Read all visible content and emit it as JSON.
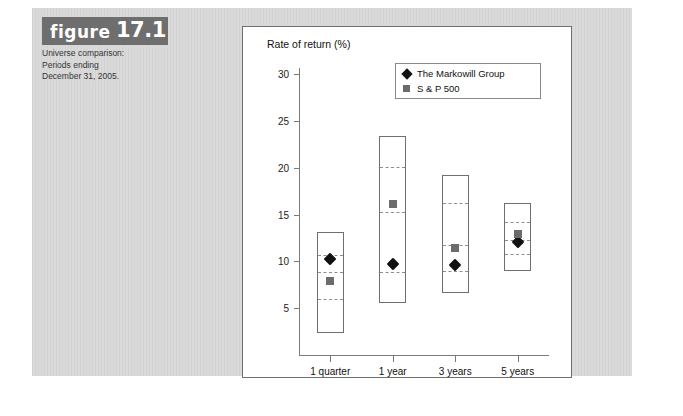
{
  "figure": {
    "tag_word": "figure",
    "tag_number": "17.1",
    "caption_lines": [
      "Universe comparison:",
      "Periods ending",
      "December 31, 2005."
    ],
    "tag_bg": "#6e6e6e",
    "plate_bg": "#d9d9d9"
  },
  "legend": {
    "items": [
      {
        "label": "The Markowill Group",
        "marker": "diamond",
        "color": "#111111"
      },
      {
        "label": "S & P 500",
        "marker": "square",
        "color": "#6b6b6b"
      }
    ]
  },
  "chart_data": {
    "type": "bar",
    "title": "",
    "ylabel": "Rate of return (%)",
    "xlabel": "",
    "ylim": [
      0,
      31
    ],
    "yticks": [
      5,
      10,
      15,
      20,
      25,
      30
    ],
    "ytick_labels": [
      "5",
      "10",
      "15",
      "20",
      "25",
      "30"
    ],
    "grid": false,
    "legend_position": "top-right",
    "categories": [
      "1 quarter",
      "1 year",
      "3 years",
      "5 years"
    ],
    "boxes": [
      {
        "category": "1 quarter",
        "max": 13.2,
        "q1_high": 10.7,
        "median": 8.9,
        "q3_low": 6.0,
        "min": 2.4
      },
      {
        "category": "1 year",
        "max": 23.4,
        "q1_high": 20.1,
        "median": 15.3,
        "q3_low": 8.9,
        "min": 5.6
      },
      {
        "category": "3 years",
        "max": 19.2,
        "q1_high": 16.2,
        "median": 11.8,
        "q3_low": 9.0,
        "min": 6.6
      },
      {
        "category": "5 years",
        "max": 16.2,
        "q1_high": 14.2,
        "median": 12.3,
        "q3_low": 10.8,
        "min": 9.0
      }
    ],
    "series": [
      {
        "name": "The Markowill Group",
        "marker": "diamond",
        "values": [
          10.3,
          9.7,
          9.6,
          12.1
        ]
      },
      {
        "name": "S & P 500",
        "marker": "square",
        "values": [
          7.9,
          16.1,
          11.4,
          12.9
        ]
      }
    ]
  }
}
